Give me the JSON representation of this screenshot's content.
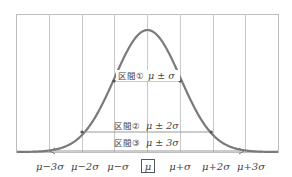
{
  "diagram": {
    "type": "normal-distribution",
    "colors": {
      "curve": "#7a7a7a",
      "grid": "#bdbdbd",
      "text": "#444444"
    },
    "intervals": [
      {
        "label": "区間①",
        "formula": "μ ± σ"
      },
      {
        "label": "区間②",
        "formula": "μ ± 2σ"
      },
      {
        "label": "区間③",
        "formula": "μ ± 3σ"
      }
    ],
    "axis_labels": [
      "μ−3σ",
      "μ−2σ",
      "μ−σ",
      "μ",
      "μ+σ",
      "μ+2σ",
      "μ+3σ"
    ]
  }
}
